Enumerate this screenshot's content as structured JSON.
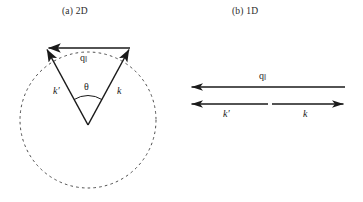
{
  "figure": {
    "background_color": "#ffffff",
    "stroke_color": "#1a1a1a",
    "width": 363,
    "height": 202
  },
  "panels": [
    {
      "id": "2d",
      "caption": "(a) 2D",
      "description": "Scattering vector diagram in two dimensions: dashed Fermi circle with incoming wavevector k and outgoing wavevector k-prime of equal length meeting at the circle center, separated by scattering angle theta; the chord joining their tips is the in-plane momentum transfer q-parallel.",
      "circle": {
        "cx": 88,
        "cy": 120,
        "r": 68,
        "style": "dashed"
      },
      "vectors": [
        {
          "name": "k",
          "label": "k",
          "from": [
            88,
            125
          ],
          "to": [
            130,
            48
          ],
          "arrow": "end"
        },
        {
          "name": "k-prime",
          "label": "k′",
          "from": [
            88,
            125
          ],
          "to": [
            46,
            48
          ],
          "arrow": "end"
        },
        {
          "name": "q-parallel",
          "label": "q",
          "sublabel": "‖",
          "from": [
            130,
            48
          ],
          "to": [
            46,
            48
          ],
          "arrow": "end"
        }
      ],
      "angle": {
        "label": "θ",
        "vertex": [
          88,
          125
        ],
        "arc_radius": 26
      }
    },
    {
      "id": "1d",
      "caption": "(b) 1D",
      "description": "Scattering vector diagram in one dimension: the momentum transfer q-parallel spans the full line pointing left, while below it k points right and k-prime points left, back-to-back along the same axis.",
      "vectors": [
        {
          "name": "q-parallel",
          "label": "q",
          "sublabel": "‖",
          "from": [
            345,
            87
          ],
          "to": [
            190,
            87
          ],
          "arrow": "end"
        },
        {
          "name": "k-prime",
          "label": "k′",
          "from": [
            268,
            104
          ],
          "to": [
            190,
            104
          ],
          "arrow": "end"
        },
        {
          "name": "k",
          "label": "k",
          "from": [
            272,
            104
          ],
          "to": [
            345,
            104
          ],
          "arrow": "end"
        }
      ]
    }
  ],
  "labels": {
    "q_symbol": "q",
    "q_subscript": "‖",
    "k_symbol": "k",
    "k_prime_symbol": "k′",
    "theta_symbol": "θ"
  }
}
